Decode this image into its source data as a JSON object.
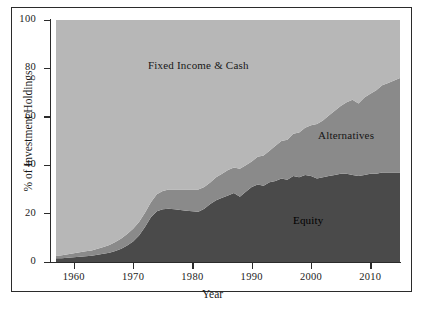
{
  "chart_data": {
    "type": "area",
    "stacked": true,
    "title": "",
    "xlabel": "Year",
    "ylabel": "% of Investment Holdings",
    "xlim": [
      1957,
      2015
    ],
    "ylim": [
      0,
      100
    ],
    "grid": false,
    "legend_position": "inline-annotations",
    "xticks": [
      1960,
      1970,
      1980,
      1990,
      2000,
      2010
    ],
    "yticks": [
      0,
      20,
      40,
      60,
      80,
      100
    ],
    "x": [
      1957,
      1958,
      1959,
      1960,
      1961,
      1962,
      1963,
      1964,
      1965,
      1966,
      1967,
      1968,
      1969,
      1970,
      1971,
      1972,
      1973,
      1974,
      1975,
      1976,
      1977,
      1978,
      1979,
      1980,
      1981,
      1982,
      1983,
      1984,
      1985,
      1986,
      1987,
      1988,
      1989,
      1990,
      1991,
      1992,
      1993,
      1994,
      1995,
      1996,
      1997,
      1998,
      1999,
      2000,
      2001,
      2002,
      2003,
      2004,
      2005,
      2006,
      2007,
      2008,
      2009,
      2010,
      2011,
      2012,
      2013,
      2014,
      2015
    ],
    "series": [
      {
        "name": "Equity",
        "color": "#4a4a4a",
        "values": [
          1.5,
          1.6,
          1.8,
          2.0,
          2.2,
          2.4,
          2.6,
          3.0,
          3.4,
          3.8,
          4.5,
          5.5,
          6.8,
          8.5,
          11.0,
          14.5,
          18.5,
          21.0,
          21.8,
          22.0,
          21.8,
          21.5,
          21.2,
          21.0,
          20.8,
          22.0,
          24.0,
          25.5,
          26.5,
          27.5,
          28.5,
          27.0,
          29.0,
          31.0,
          32.0,
          31.5,
          33.0,
          33.5,
          34.5,
          34.0,
          35.5,
          35.0,
          36.0,
          35.5,
          34.5,
          35.0,
          35.5,
          36.0,
          36.5,
          36.5,
          36.0,
          35.5,
          36.0,
          36.5,
          36.5,
          37.0,
          37.0,
          37.0,
          37.0
        ]
      },
      {
        "name": "Alternatives",
        "color": "#8a8a8a",
        "values": [
          1.0,
          1.2,
          1.4,
          1.6,
          1.8,
          2.0,
          2.2,
          2.5,
          2.8,
          3.2,
          3.8,
          4.2,
          4.8,
          5.2,
          5.5,
          5.8,
          6.2,
          7.0,
          7.5,
          8.0,
          8.2,
          8.5,
          8.8,
          9.0,
          9.2,
          9.0,
          8.8,
          9.5,
          10.0,
          10.5,
          10.5,
          11.5,
          11.0,
          10.5,
          11.5,
          12.5,
          13.0,
          14.5,
          15.5,
          16.5,
          17.5,
          18.5,
          19.5,
          21.0,
          22.5,
          23.5,
          25.0,
          26.5,
          28.0,
          29.5,
          31.0,
          30.0,
          32.0,
          33.0,
          34.5,
          36.0,
          37.0,
          38.0,
          39.0
        ]
      },
      {
        "name": "Fixed Income & Cash",
        "color": "#b7b7b7",
        "values": [
          97.5,
          97.2,
          96.8,
          96.4,
          96.0,
          95.6,
          95.2,
          94.5,
          93.8,
          93.0,
          91.7,
          90.3,
          88.4,
          86.3,
          83.5,
          79.7,
          75.3,
          72.0,
          70.7,
          70.0,
          70.0,
          70.0,
          70.0,
          70.0,
          70.0,
          69.0,
          67.2,
          65.0,
          63.5,
          62.0,
          61.0,
          61.5,
          60.0,
          58.5,
          56.5,
          56.0,
          54.0,
          52.0,
          50.0,
          49.5,
          47.0,
          46.5,
          44.5,
          43.5,
          43.0,
          41.5,
          39.5,
          37.5,
          35.5,
          34.0,
          33.0,
          34.5,
          32.0,
          30.5,
          29.0,
          27.0,
          26.0,
          25.0,
          24.0
        ]
      }
    ],
    "annotations": [
      {
        "text": "Fixed Income & Cash",
        "series": "Fixed Income & Cash"
      },
      {
        "text": "Alternatives",
        "series": "Alternatives"
      },
      {
        "text": "Equity",
        "series": "Equity"
      }
    ]
  },
  "axes": {
    "x_title": "Year",
    "y_title": "% of Investment Holdings",
    "x_tick_labels": [
      "1960",
      "1970",
      "1980",
      "1990",
      "2000",
      "2010"
    ],
    "y_tick_labels": [
      "0",
      "20",
      "40",
      "60",
      "80",
      "100"
    ]
  },
  "labels": {
    "fixed_income": "Fixed Income & Cash",
    "alternatives": "Alternatives",
    "equity": "Equity"
  },
  "colors": {
    "equity": "#4a4a4a",
    "alternatives": "#8a8a8a",
    "fixed_income": "#b7b7b7",
    "axis": "#2b2b2b",
    "background": "#ffffff"
  }
}
